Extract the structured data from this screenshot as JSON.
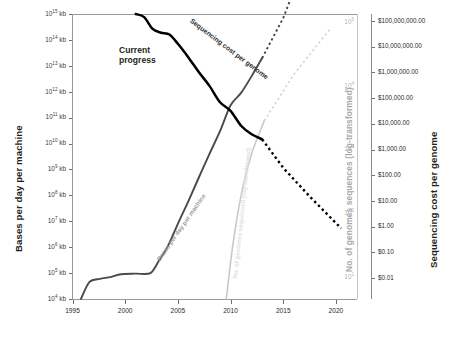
{
  "chart_data": {
    "type": "line",
    "title": "",
    "xlabel": "",
    "x_ticks": [
      "1995",
      "2000",
      "2005",
      "2010",
      "2015",
      "2020"
    ],
    "xlim": [
      1995,
      2022
    ],
    "grid": false,
    "legend": "inline-annotations",
    "axes": {
      "left": {
        "label": "Bases per day per machine",
        "scale": "log",
        "ticks": [
          "10¹⁵ kb",
          "10¹⁴ kb",
          "10¹³ kb",
          "10¹² kb",
          "10¹¹ kb",
          "10¹⁰ kb",
          "10⁹ kb",
          "10⁸ kb",
          "10⁷ kb",
          "10⁶ kb",
          "10⁵ kb",
          "10⁴ kb"
        ],
        "tick_mantissas": [
          "10",
          "10",
          "10",
          "10",
          "10",
          "10",
          "10",
          "10",
          "10",
          "10",
          "10",
          "10"
        ],
        "tick_exponents": [
          "15",
          "14",
          "13",
          "12",
          "11",
          "10",
          "9",
          "8",
          "7",
          "6",
          "5",
          "4"
        ],
        "tick_unit": "kb"
      },
      "middle_right": {
        "label": "No. of genomes sequences (log-transformed)",
        "scale": "log",
        "tick_mantissas": [
          "10",
          "10",
          "10",
          "10",
          "10"
        ],
        "tick_exponents": [
          "5",
          "4",
          "3",
          "2",
          "1"
        ]
      },
      "right": {
        "label": "Sequencing cost per genome",
        "scale": "log",
        "ticks": [
          "$100,000,000.00",
          "$10,000,000.00",
          "$1,000,000.00",
          "$100,000.00",
          "$10,000.00",
          "$1,000.00",
          "$100.00",
          "$10.00",
          "$1.00",
          "$0.10",
          "$0.01"
        ]
      }
    },
    "series": [
      {
        "name": "Sequencing cost per genome",
        "inline_label": "Sequencing cost per genome",
        "color": "#000000",
        "style": "solid-then-dashed",
        "axis": "right",
        "points": [
          [
            2001.0,
            100000000
          ],
          [
            2001.8,
            78000000
          ],
          [
            2002.6,
            30000000
          ],
          [
            2003.4,
            22000000
          ],
          [
            2004.2,
            19000000
          ],
          [
            2005.0,
            9000000
          ],
          [
            2006.0,
            3000000
          ],
          [
            2007.0,
            900000
          ],
          [
            2008.0,
            300000
          ],
          [
            2009.0,
            80000
          ],
          [
            2010.0,
            40000
          ],
          [
            2011.0,
            12000
          ],
          [
            2012.0,
            6000
          ],
          [
            2013.0,
            4000
          ]
        ],
        "projection_points": [
          [
            2013.0,
            4000
          ],
          [
            2015.0,
            400
          ],
          [
            2017.5,
            40
          ],
          [
            2020.5,
            3
          ]
        ]
      },
      {
        "name": "Bases per day per machine",
        "inline_label": "Bases per day per machine",
        "color": "#4a4a4a",
        "style": "solid-then-dashed",
        "axis": "left",
        "points": [
          [
            1995.8,
            10000
          ],
          [
            1996.6,
            45000
          ],
          [
            1997.6,
            60000
          ],
          [
            1998.6,
            70000
          ],
          [
            1999.6,
            90000
          ],
          [
            2001.0,
            95000
          ],
          [
            2002.4,
            100000
          ],
          [
            2003.2,
            300000
          ],
          [
            2004.0,
            1000000
          ],
          [
            2005.0,
            8000000
          ],
          [
            2006.0,
            60000000
          ],
          [
            2007.0,
            500000000
          ],
          [
            2008.0,
            4000000000
          ],
          [
            2009.0,
            30000000000
          ],
          [
            2010.0,
            300000000000
          ],
          [
            2011.0,
            900000000000
          ],
          [
            2012.0,
            4000000000000
          ],
          [
            2013.0,
            20000000000000
          ]
        ],
        "projection_points": [
          [
            2013.0,
            20000000000000
          ],
          [
            2015.0,
            700000000000000
          ],
          [
            2017.0,
            90000000000000000
          ]
        ]
      },
      {
        "name": "No. of genomes sequenced",
        "inline_label": "No. of genomes sequenced (log-transformed)",
        "color": "#c9c9c9",
        "style": "solid-then-dashed",
        "axis": "middle_right",
        "points": [
          [
            2009.6,
            1
          ],
          [
            2010.2,
            30
          ],
          [
            2011.0,
            800
          ],
          [
            2012.0,
            12000
          ],
          [
            2013.2,
            100000
          ]
        ],
        "projection_points": [
          [
            2013.2,
            100000
          ],
          [
            2016.0,
            2000000
          ],
          [
            2019.5,
            40000000
          ]
        ]
      }
    ],
    "annotations": [
      {
        "text": "Current\nprogress",
        "line1": "Current",
        "line2": "progress"
      }
    ]
  },
  "annotations": {
    "current_progress_line1": "Current",
    "current_progress_line2": "progress"
  }
}
